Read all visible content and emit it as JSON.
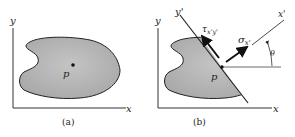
{
  "panels": [
    {
      "id": "a",
      "caption": "(a)",
      "axes": {
        "x_label": "x",
        "y_label": "y"
      },
      "point_label": "p"
    },
    {
      "id": "b",
      "caption": "(b)",
      "axes": {
        "x_label": "x",
        "y_label": "y"
      },
      "rotated_axes": {
        "x_label": "x'",
        "y_label": "y'"
      },
      "point_label": "p",
      "normal_stress_label": "σx'",
      "shear_stress_label": "τx'y'",
      "angle_label": "θ"
    }
  ],
  "colors": {
    "body_fill": "#b8b8b8",
    "stroke": "#222222"
  }
}
